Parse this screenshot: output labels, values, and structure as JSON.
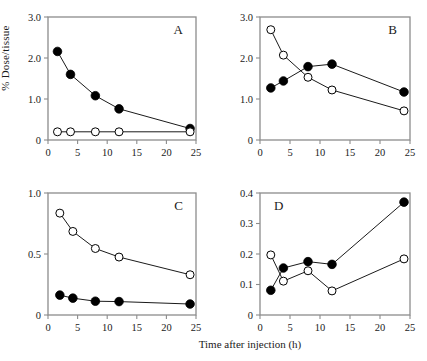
{
  "figure": {
    "ylabel": "% Dose/tissue",
    "xlabel": "Time after injection (h)",
    "background": "#ffffff",
    "frame_color": "#8c8c8c",
    "line_color": "#000000",
    "marker_filled_color": "#000000",
    "marker_open_color": "#ffffff"
  },
  "chart_data": [
    {
      "type": "line",
      "panel": "A",
      "label_position": "top-right",
      "title": "A",
      "xlabel": "",
      "ylabel": "",
      "xlim": [
        0,
        25
      ],
      "ylim": [
        0,
        3.0
      ],
      "xticks": [
        0,
        5,
        10,
        15,
        20,
        25
      ],
      "xticklabels": [
        "0",
        "5",
        "10",
        "15",
        "20",
        "25"
      ],
      "yticks": [
        0,
        1.0,
        2.0,
        3.0
      ],
      "yticklabels": [
        "0",
        "1.0",
        "2.0",
        "3.0"
      ],
      "grid": false,
      "legend": null,
      "series": [
        {
          "name": "filled",
          "marker": "filled-circle",
          "x": [
            1.6,
            3.8,
            8.0,
            12.0,
            24.0
          ],
          "values": [
            2.16,
            1.6,
            1.08,
            0.76,
            0.28
          ]
        },
        {
          "name": "open",
          "marker": "open-circle",
          "x": [
            1.6,
            3.8,
            8.0,
            12.0,
            24.0
          ],
          "values": [
            0.2,
            0.2,
            0.2,
            0.2,
            0.2
          ]
        }
      ]
    },
    {
      "type": "line",
      "panel": "B",
      "label_position": "top-right",
      "title": "B",
      "xlabel": "",
      "ylabel": "",
      "xlim": [
        0,
        25
      ],
      "ylim": [
        0,
        3.0
      ],
      "xticks": [
        0,
        5,
        10,
        15,
        20,
        25
      ],
      "xticklabels": [
        "0",
        "5",
        "10",
        "15",
        "20",
        "25"
      ],
      "yticks": [
        0,
        1.0,
        2.0,
        3.0
      ],
      "yticklabels": [
        "0",
        "1.0",
        "2.0",
        "3.0"
      ],
      "grid": false,
      "legend": null,
      "series": [
        {
          "name": "filled",
          "marker": "filled-circle",
          "x": [
            1.8,
            3.9,
            8.0,
            12.0,
            24.0
          ],
          "values": [
            1.27,
            1.44,
            1.79,
            1.85,
            1.17
          ]
        },
        {
          "name": "open",
          "marker": "open-circle",
          "x": [
            1.8,
            3.9,
            8.0,
            12.0,
            24.0
          ],
          "values": [
            2.69,
            2.07,
            1.53,
            1.22,
            0.71
          ]
        }
      ]
    },
    {
      "type": "line",
      "panel": "C",
      "label_position": "top-right",
      "title": "C",
      "xlabel": "Time after injection (h)",
      "ylabel": "% Dose/tissue",
      "xlim": [
        0,
        25
      ],
      "ylim": [
        0,
        1.0
      ],
      "xticks": [
        0,
        5,
        10,
        15,
        20,
        25
      ],
      "xticklabels": [
        "0",
        "5",
        "10",
        "15",
        "20",
        "25"
      ],
      "yticks": [
        0,
        0.5,
        1.0
      ],
      "yticklabels": [
        "0",
        "0.5",
        "1.0"
      ],
      "grid": false,
      "legend": null,
      "series": [
        {
          "name": "filled",
          "marker": "filled-circle",
          "x": [
            2.0,
            4.2,
            8.0,
            12.0,
            24.0
          ],
          "values": [
            0.163,
            0.138,
            0.113,
            0.11,
            0.09
          ]
        },
        {
          "name": "open",
          "marker": "open-circle",
          "x": [
            2.0,
            4.2,
            8.0,
            12.0,
            24.0
          ],
          "values": [
            0.835,
            0.685,
            0.545,
            0.475,
            0.33
          ]
        }
      ]
    },
    {
      "type": "line",
      "panel": "D",
      "label_position": "top-left",
      "title": "D",
      "xlabel": "Time after injection (h)",
      "ylabel": "",
      "xlim": [
        0,
        25
      ],
      "ylim": [
        0,
        0.4
      ],
      "xticks": [
        0,
        5,
        10,
        15,
        20,
        25
      ],
      "xticklabels": [
        "0",
        "5",
        "10",
        "15",
        "20",
        "25"
      ],
      "yticks": [
        0,
        0.1,
        0.2,
        0.3,
        0.4
      ],
      "yticklabels": [
        "0",
        "0.1",
        "0.2",
        "0.3",
        "0.4"
      ],
      "grid": false,
      "legend": null,
      "series": [
        {
          "name": "filled",
          "marker": "filled-circle",
          "x": [
            1.8,
            3.9,
            8.0,
            12.0,
            24.0
          ],
          "values": [
            0.081,
            0.154,
            0.175,
            0.166,
            0.37
          ]
        },
        {
          "name": "open",
          "marker": "open-circle",
          "x": [
            1.8,
            3.9,
            8.0,
            12.0,
            24.0
          ],
          "values": [
            0.197,
            0.111,
            0.145,
            0.079,
            0.184
          ]
        }
      ]
    }
  ]
}
